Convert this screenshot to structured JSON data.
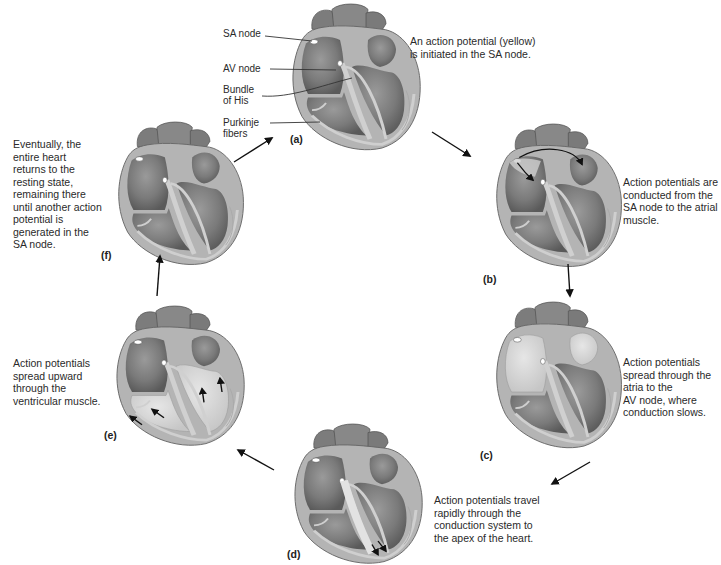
{
  "diagram": {
    "colors": {
      "heart_dark": "#6e6e6e",
      "heart_mid": "#8c8c8c",
      "heart_light": "#bdbdbd",
      "conduction_path": "#c8c8c8",
      "depolarized": "#d9d9d9",
      "node": "#ffffff",
      "arrow": "#111111"
    },
    "structure_labels": {
      "sa_node": "SA node",
      "av_node": "AV node",
      "bundle_of_his_1": "Bundle",
      "bundle_of_his_2": "of His",
      "purkinje_1": "Purkinje",
      "purkinje_2": "fibers"
    },
    "panels": [
      {
        "id": "a",
        "label": "(a)",
        "caption": [
          "An action potential (yellow)",
          "is initiated in the SA node."
        ]
      },
      {
        "id": "b",
        "label": "(b)",
        "caption": [
          "Action potentials are",
          "conducted from the",
          "SA node to the atrial",
          "muscle."
        ]
      },
      {
        "id": "c",
        "label": "(c)",
        "caption": [
          "Action potentials",
          "spread through the",
          "atria to the",
          "AV node, where",
          "conduction slows."
        ]
      },
      {
        "id": "d",
        "label": "(d)",
        "caption": [
          "Action potentials travel",
          "rapidly through the",
          "conduction system to",
          "the apex of the heart."
        ]
      },
      {
        "id": "e",
        "label": "(e)",
        "caption": [
          "Action potentials",
          "spread upward",
          "through the",
          "ventricular muscle."
        ]
      },
      {
        "id": "f",
        "label": "(f)",
        "caption": [
          "Eventually, the",
          "entire heart",
          "returns to the",
          "resting state,",
          "remaining there",
          "until another action",
          "potential is",
          "generated in the",
          "SA node."
        ]
      }
    ]
  }
}
